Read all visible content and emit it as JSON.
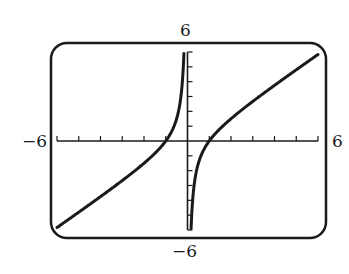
{
  "chart_data": {
    "type": "line",
    "title": "",
    "function": "y = x - 1/x",
    "xlabel": "",
    "ylabel": "",
    "xlim": [
      -6,
      6
    ],
    "ylim": [
      -6,
      6
    ],
    "x_tick_step": 1,
    "y_tick_step": 1,
    "grid": false,
    "legend": null,
    "window_labels": {
      "xmin": "−6",
      "xmax": "6",
      "ymin": "−6",
      "ymax": "6"
    },
    "series": [
      {
        "name": "left branch",
        "x": [
          -6,
          -5,
          -4,
          -3,
          -2,
          -1.5,
          -1,
          -0.75,
          -0.5,
          -0.3,
          -0.2,
          -0.17
        ],
        "y": [
          -5.83,
          -4.8,
          -3.75,
          -2.67,
          -1.5,
          -0.83,
          0,
          0.58,
          1.5,
          3.03,
          4.8,
          5.71
        ]
      },
      {
        "name": "right branch",
        "x": [
          0.17,
          0.2,
          0.3,
          0.5,
          0.75,
          1,
          1.5,
          2,
          3,
          4,
          5,
          6
        ],
        "y": [
          -5.71,
          -4.8,
          -3.03,
          -1.5,
          -0.58,
          0,
          0.83,
          1.5,
          2.67,
          3.75,
          4.8,
          5.83
        ]
      }
    ],
    "x_intercepts": [
      -1,
      1
    ],
    "vertical_asymptote": 0
  },
  "colors": {
    "curve": "#1a1a1a",
    "frame": "#1a1a1a",
    "axes": "#1a1a1a",
    "background": "#ffffff"
  }
}
